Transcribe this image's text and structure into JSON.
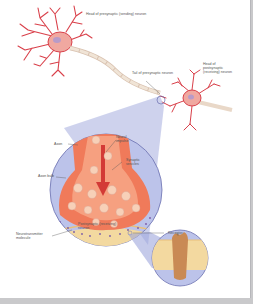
{
  "diagram": {
    "labels": {
      "presynaptic_head": "Head of presynaptic (sending) neuron",
      "presynaptic_tail": "Tail of presynaptic neuron",
      "postsynaptic_head": "Head of postsynaptic (receiving) neuron",
      "axon": "Axon",
      "neural_impulse": "Neural impulse",
      "synaptic_vesicles": "Synaptic vesicles",
      "axon_bulb": "Axon bulb",
      "receptor": "Receptor",
      "neurotransmitter": "Neurotransmitter molecule",
      "postsynaptic_neuron": "Postsynaptic (receiving) neuron"
    },
    "colors": {
      "neuron": "#d9404a",
      "cell_body": "#f0a8a0",
      "axon_sheath": "#e9d8c8",
      "magnify_bg": "#b9bfe6",
      "bulb": "#f07a5a",
      "membrane": "#f3d9a0",
      "receptor": "#c98a55"
    }
  }
}
